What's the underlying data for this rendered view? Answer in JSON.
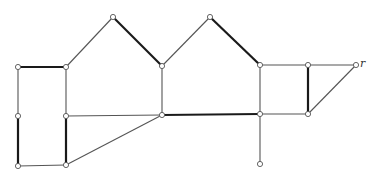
{
  "diagram": {
    "type": "graph",
    "node_radius": 2.6,
    "nodes": [
      {
        "id": "a",
        "x": 18,
        "y": 67
      },
      {
        "id": "b",
        "x": 66,
        "y": 67
      },
      {
        "id": "c",
        "x": 113,
        "y": 17
      },
      {
        "id": "d",
        "x": 162,
        "y": 66
      },
      {
        "id": "e",
        "x": 210,
        "y": 17
      },
      {
        "id": "f",
        "x": 260,
        "y": 65
      },
      {
        "id": "g",
        "x": 308,
        "y": 65
      },
      {
        "id": "r",
        "x": 356,
        "y": 65,
        "label": "r"
      },
      {
        "id": "h",
        "x": 18,
        "y": 116
      },
      {
        "id": "i",
        "x": 66,
        "y": 116
      },
      {
        "id": "j",
        "x": 162,
        "y": 115
      },
      {
        "id": "k",
        "x": 260,
        "y": 114
      },
      {
        "id": "l",
        "x": 308,
        "y": 114
      },
      {
        "id": "m",
        "x": 18,
        "y": 166
      },
      {
        "id": "n",
        "x": 66,
        "y": 165
      },
      {
        "id": "o",
        "x": 260,
        "y": 164
      }
    ],
    "edges": [
      {
        "from": "a",
        "to": "b",
        "thick": true
      },
      {
        "from": "a",
        "to": "h",
        "thick": false
      },
      {
        "from": "h",
        "to": "m",
        "thick": true
      },
      {
        "from": "m",
        "to": "n",
        "thick": false
      },
      {
        "from": "b",
        "to": "i",
        "thick": false
      },
      {
        "from": "i",
        "to": "n",
        "thick": true
      },
      {
        "from": "b",
        "to": "c",
        "thick": false
      },
      {
        "from": "c",
        "to": "d",
        "thick": true
      },
      {
        "from": "d",
        "to": "e",
        "thick": false
      },
      {
        "from": "e",
        "to": "f",
        "thick": true
      },
      {
        "from": "d",
        "to": "j",
        "thick": false
      },
      {
        "from": "i",
        "to": "j",
        "thick": false
      },
      {
        "from": "n",
        "to": "j",
        "thick": false
      },
      {
        "from": "j",
        "to": "k",
        "thick": true
      },
      {
        "from": "f",
        "to": "k",
        "thick": false
      },
      {
        "from": "k",
        "to": "o",
        "thick": false
      },
      {
        "from": "f",
        "to": "g",
        "thick": false
      },
      {
        "from": "g",
        "to": "r",
        "thick": false
      },
      {
        "from": "g",
        "to": "l",
        "thick": true
      },
      {
        "from": "k",
        "to": "l",
        "thick": false
      },
      {
        "from": "l",
        "to": "r",
        "thick": false
      }
    ]
  }
}
